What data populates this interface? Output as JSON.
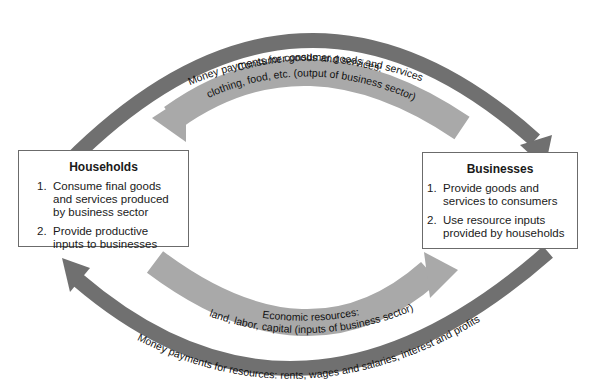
{
  "diagram": {
    "type": "circular-flow",
    "colors": {
      "outer_arrow": "#707070",
      "inner_arrow": "#a9a9a9",
      "box_border": "#6b6b6b",
      "text": "#1a1a1a"
    },
    "top_outer_arrow": {
      "label": "Money payments for consumer goods and services",
      "direction": "households-to-businesses"
    },
    "top_inner_arrow": {
      "line1": "Consumer goods and services:",
      "line2": "clothing, food, etc. (output of business sector)",
      "direction": "businesses-to-households"
    },
    "bottom_inner_arrow": {
      "line1": "Economic resources:",
      "line2": "land, labor, capital (inputs of business sector)",
      "direction": "households-to-businesses"
    },
    "bottom_outer_arrow": {
      "label": "Money payments for resources:  rents, wages and salaries, interest and profits",
      "direction": "businesses-to-households"
    },
    "households": {
      "title": "Households",
      "items": [
        {
          "num": "1.",
          "text": "Consume final goods and services produced by business sector"
        },
        {
          "num": "2.",
          "text": "Provide productive inputs to businesses"
        }
      ]
    },
    "businesses": {
      "title": "Businesses",
      "items": [
        {
          "num": "1.",
          "text": "Provide goods and services to consumers"
        },
        {
          "num": "2.",
          "text": "Use resource inputs provided by households"
        }
      ]
    }
  }
}
